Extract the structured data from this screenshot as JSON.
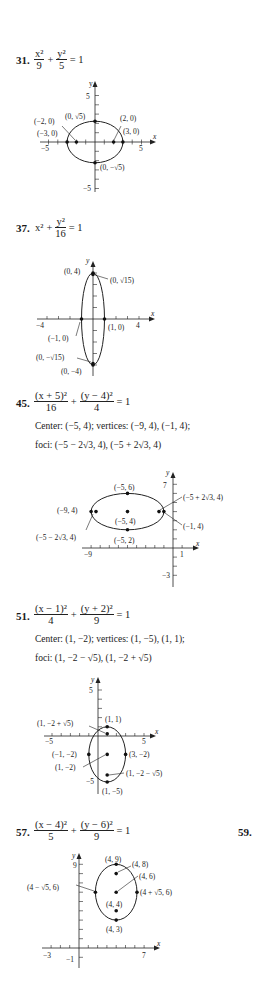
{
  "problems": [
    {
      "number": "31.",
      "equation": {
        "term1_num": "x²",
        "term1_den": "9",
        "plus": "+",
        "term2_num": "y²",
        "term2_den": "5",
        "rhs": "= 1"
      },
      "labels": [
        "(0, √5)",
        "(−2, 0)",
        "(−3, 0)",
        "(2, 0)",
        "(3, 0)",
        "(0, −√5)",
        "5",
        "−5",
        "5",
        "−5",
        "x",
        "y"
      ]
    },
    {
      "number": "37.",
      "equation": {
        "term1": "x²",
        "plus": "+",
        "term2_num": "y²",
        "term2_den": "16",
        "rhs": "= 1"
      },
      "labels": [
        "(0, 4)",
        "(0, √15)",
        "(−1, 0)",
        "(1, 0)",
        "(0, −√15)",
        "(0, −4)",
        "−4",
        "4",
        "x",
        "y"
      ]
    },
    {
      "number": "45.",
      "equation": {
        "term1_num": "(x + 5)²",
        "term1_den": "16",
        "plus": "+",
        "term2_num": "(y − 4)²",
        "term2_den": "4",
        "rhs": "= 1"
      },
      "info_line1": "Center: (−5, 4); vertices: (−9, 4), (−1, 4);",
      "info_line2": "foci: (−5 − 2√3, 4), (−5 + 2√3, 4)",
      "labels": [
        "(−5, 6)",
        "(−5 + 2√3, 4)",
        "(−9, 4)",
        "(−5, 4)",
        "(−1, 4)",
        "(−5 − 2√3, 4)",
        "(−5, 2)",
        "−9",
        "1",
        "7",
        "−3",
        "x",
        "y"
      ]
    },
    {
      "number": "51.",
      "equation": {
        "term1_num": "(x − 1)²",
        "term1_den": "4",
        "plus": "+",
        "term2_num": "(y + 2)²",
        "term2_den": "9",
        "rhs": "= 1"
      },
      "info_line1": "Center: (1, −2); vertices: (1, −5), (1, 1);",
      "info_line2": "foci: (1, −2 − √5), (1, −2 + √5)",
      "labels": [
        "(1, 1)",
        "(1, −2 + √5)",
        "(−1, −2)",
        "(3, −2)",
        "(1, −2)",
        "(1, −2 − √5)",
        "(1, −5)",
        "5",
        "−5",
        "5",
        "−5",
        "x",
        "y"
      ]
    },
    {
      "number": "57.",
      "equation": {
        "term1_num": "(x − 4)²",
        "term1_den": "5",
        "plus": "+",
        "term2_num": "(y − 6)²",
        "term2_den": "9",
        "rhs": "= 1"
      },
      "labels": [
        "(4, 9)",
        "(4, 8)",
        "(4, 6)",
        "(4 − √5, 6)",
        "(4 + √5, 6)",
        "(4, 4)",
        "(4, 3)",
        "9",
        "−3",
        "−1",
        "7",
        "x",
        "y"
      ]
    }
  ],
  "next_problem_number": "59."
}
